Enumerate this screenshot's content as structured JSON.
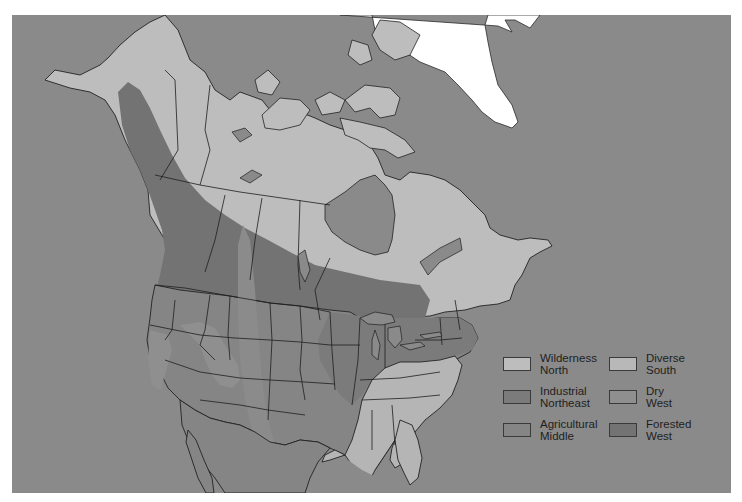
{
  "map": {
    "description": "Regions of North America",
    "colors": {
      "ocean": "#8a8a8a",
      "wilderness_north": "#bdbdbd",
      "diverse_south": "#b5b5b5",
      "industrial_northeast": "#7b7b7b",
      "dry_west": "#8f8f8f",
      "agricultural_middle": "#858585",
      "forested_west": "#737373",
      "greenland": "#ffffff",
      "border": "#1e1e1e"
    }
  },
  "legend": {
    "items": [
      {
        "id": "wilderness-north",
        "line1": "Wilderness",
        "line2": "North",
        "color": "#bdbdbd"
      },
      {
        "id": "diverse-south",
        "line1": "Diverse",
        "line2": "South",
        "color": "#b8b8b8"
      },
      {
        "id": "industrial-northeast",
        "line1": "Industrial",
        "line2": "Northeast",
        "color": "#7b7b7b"
      },
      {
        "id": "dry-west",
        "line1": "Dry",
        "line2": "West",
        "color": "#8f8f8f"
      },
      {
        "id": "agricultural-middle",
        "line1": "Agricultural",
        "line2": "Middle",
        "color": "#858585"
      },
      {
        "id": "forested-west",
        "line1": "Forested",
        "line2": "West",
        "color": "#737373"
      }
    ]
  }
}
